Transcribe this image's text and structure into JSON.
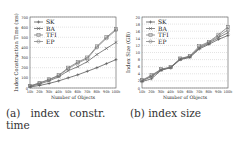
{
  "chart_data": [
    {
      "type": "line",
      "title": "",
      "caption": "(a) index constr. time",
      "xlabel": "Number of Objects",
      "ylabel": "Index Construction Time (ms)",
      "x": [
        "10k",
        "20k",
        "30k",
        "40k",
        "50k",
        "60k",
        "70k",
        "80k",
        "90k",
        "100k"
      ],
      "ylim": [
        0,
        700
      ],
      "yticks": [
        0,
        100,
        200,
        300,
        400,
        500,
        600,
        700
      ],
      "grid": true,
      "legend_position": "upper left",
      "series": [
        {
          "name": "SK",
          "marker": "+",
          "values": [
            10,
            25,
            45,
            70,
            100,
            130,
            165,
            200,
            240,
            280
          ]
        },
        {
          "name": "BA",
          "marker": "x",
          "values": [
            15,
            40,
            70,
            110,
            170,
            210,
            260,
            330,
            390,
            450
          ]
        },
        {
          "name": "TFI",
          "marker": "square",
          "values": [
            20,
            50,
            85,
            125,
            200,
            255,
            300,
            410,
            500,
            580
          ]
        },
        {
          "name": "EP",
          "marker": "circle",
          "values": [
            20,
            48,
            80,
            120,
            190,
            245,
            290,
            400,
            490,
            570
          ]
        }
      ]
    },
    {
      "type": "line",
      "title": "",
      "caption": "(b) index size",
      "xlabel": "Number of Objects",
      "ylabel": "Index Size (GB)",
      "x": [
        "10k",
        "20k",
        "30k",
        "40k",
        "50k",
        "60k",
        "70k",
        "80k",
        "90k",
        "100k"
      ],
      "ylim": [
        0,
        20
      ],
      "yticks": [
        0,
        2,
        4,
        6,
        8,
        10,
        12,
        14,
        16,
        18,
        20
      ],
      "grid": true,
      "legend_position": "upper left",
      "series": [
        {
          "name": "SK",
          "marker": "+",
          "values": [
            1.8,
            2.6,
            5.0,
            5.7,
            8.0,
            8.6,
            11.0,
            12.3,
            13.7,
            14.8
          ]
        },
        {
          "name": "BA",
          "marker": "x",
          "values": [
            2.0,
            3.2,
            5.1,
            5.8,
            8.1,
            8.8,
            11.3,
            12.6,
            14.2,
            15.6
          ]
        },
        {
          "name": "TFI",
          "marker": "square",
          "values": [
            2.2,
            3.6,
            5.3,
            5.9,
            8.3,
            9.0,
            11.8,
            13.0,
            15.0,
            17.2
          ]
        },
        {
          "name": "EP",
          "marker": "circle",
          "values": [
            2.1,
            3.4,
            5.2,
            5.8,
            8.2,
            8.9,
            11.5,
            12.8,
            14.6,
            16.4
          ]
        }
      ]
    }
  ],
  "captions": {
    "a_line1": "(a)   index   constr.",
    "a_line2": "time",
    "b_line1": "(b) index size"
  }
}
